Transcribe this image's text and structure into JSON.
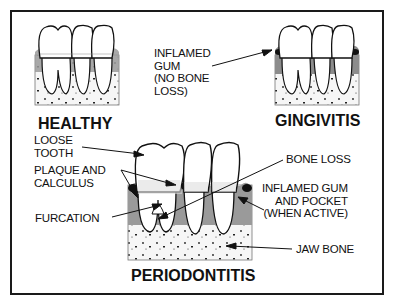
{
  "diagram": {
    "panels": [
      {
        "id": "healthy",
        "title": "HEALTHY"
      },
      {
        "id": "gingivitis",
        "title": "GINGIVITIS"
      },
      {
        "id": "periodontitis",
        "title": "PERIODONTITIS"
      }
    ],
    "labels": {
      "inflamed_gum_no_bone_loss": "INFLAMED\nGUM\n(NO BONE\nLOSS)",
      "loose_tooth": "LOOSE\nTOOTH",
      "plaque_and_calculus": "PLAQUE AND\nCALCULUS",
      "furcation": "FURCATION",
      "bone_loss": "BONE LOSS",
      "inflamed_gum_and_pocket": "INFLAMED GUM\nAND POCKET\n(WHEN ACTIVE)",
      "jaw_bone": "JAW BONE"
    },
    "colors": {
      "line": "#111111",
      "gum": "#9a9a9a",
      "bone": "#f4f4f4",
      "frame": "#1a1a1a"
    }
  }
}
